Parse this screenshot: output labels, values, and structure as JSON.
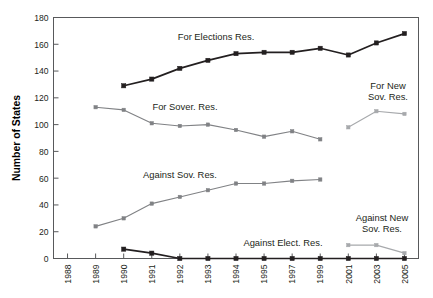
{
  "chart_data": {
    "type": "line",
    "title": "",
    "xlabel": "",
    "ylabel": "Number of States",
    "ylim": [
      0,
      180
    ],
    "ytick_step": 20,
    "grid": false,
    "legend": "inline-annotations",
    "categories": [
      "1988",
      "1989",
      "1990",
      "1991",
      "1992",
      "1993",
      "1994",
      "1995",
      "1997",
      "1999",
      "2001",
      "2003",
      "2005"
    ],
    "yticks": [
      "0",
      "20",
      "40",
      "60",
      "80",
      "100",
      "120",
      "140",
      "160",
      "180"
    ],
    "series": [
      {
        "name": "For Elections Res.",
        "color": "#231f20",
        "label_x": "1993",
        "x": [
          "1990",
          "1991",
          "1992",
          "1993",
          "1994",
          "1995",
          "1997",
          "1999",
          "2001",
          "2003",
          "2005"
        ],
        "values": [
          129,
          134,
          142,
          148,
          153,
          154,
          154,
          157,
          152,
          161,
          168
        ]
      },
      {
        "name": "For Sover. Res.",
        "color": "#808285",
        "label_x": "1991",
        "x": [
          "1989",
          "1990",
          "1991",
          "1992",
          "1993",
          "1994",
          "1995",
          "1997",
          "1999"
        ],
        "values": [
          113,
          111,
          101,
          99,
          100,
          96,
          91,
          95,
          89
        ]
      },
      {
        "name": "Against Sov. Res.",
        "color": "#808285",
        "label_x": "1992",
        "x": [
          "1989",
          "1990",
          "1991",
          "1992",
          "1993",
          "1994",
          "1995",
          "1997",
          "1999"
        ],
        "values": [
          24,
          30,
          41,
          46,
          51,
          56,
          56,
          58,
          59
        ]
      },
      {
        "name": "Against Elect. Res.",
        "color": "#231f20",
        "label_x": "1995",
        "x": [
          "1990",
          "1991",
          "1992",
          "1993",
          "1994",
          "1995",
          "1997",
          "1999",
          "2001",
          "2003",
          "2005"
        ],
        "values": [
          7,
          4,
          0,
          0,
          0,
          0,
          0,
          0,
          0,
          0,
          0
        ]
      },
      {
        "name": "For New Sov. Res.",
        "color": "#a7a9ac",
        "label_x": "2003",
        "x": [
          "2001",
          "2003",
          "2005"
        ],
        "values": [
          98,
          110,
          108
        ]
      },
      {
        "name": "Against New Sov. Res.",
        "color": "#a7a9ac",
        "label_x": "2003",
        "x": [
          "2001",
          "2003",
          "2005"
        ],
        "values": [
          10,
          10,
          4
        ]
      }
    ],
    "annotations": [
      {
        "text": "For Elections Res.",
        "x": 216,
        "y": 40,
        "anchor": "middle"
      },
      {
        "text": "For Sover. Res.",
        "x": 185,
        "y": 110,
        "anchor": "middle"
      },
      {
        "text": "Against Sov. Res.",
        "x": 180,
        "y": 178,
        "anchor": "middle"
      },
      {
        "text": "Against Elect. Res.",
        "x": 283,
        "y": 246,
        "anchor": "middle"
      },
      {
        "text": "For New",
        "x": 388,
        "y": 89,
        "anchor": "middle"
      },
      {
        "text": "Sov. Res.",
        "x": 388,
        "y": 100,
        "anchor": "middle"
      },
      {
        "text": "Against New",
        "x": 382,
        "y": 221,
        "anchor": "middle"
      },
      {
        "text": "Sov. Res.",
        "x": 382,
        "y": 232,
        "anchor": "middle"
      }
    ]
  },
  "axis": {
    "y_title": "Number of States"
  }
}
